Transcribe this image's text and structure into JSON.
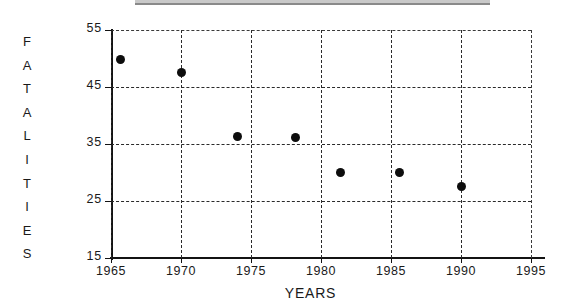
{
  "chart_data": {
    "type": "scatter",
    "title": "",
    "xlabel": "YEARS",
    "ylabel": "FATALITIES",
    "ylabel_letters": [
      "F",
      "A",
      "T",
      "A",
      "L",
      "I",
      "T",
      "I",
      "E",
      "S"
    ],
    "xlim": [
      1965,
      1995
    ],
    "ylim": [
      15,
      55
    ],
    "xticks": [
      1965,
      1970,
      1975,
      1980,
      1985,
      1990,
      1995
    ],
    "xtick_labels": [
      "1965",
      "1970",
      "1975",
      "1980",
      "1985",
      "1990",
      "1995"
    ],
    "yticks": [
      15,
      25,
      35,
      45,
      55
    ],
    "ytick_labels": [
      "15",
      "25",
      "35",
      "45",
      "55"
    ],
    "grid": true,
    "grid_style": "dashed",
    "legend": "none",
    "marker": "filled-circle",
    "marker_color": "#0d0d0d",
    "axis_color": "#131313",
    "background": "#ffffff",
    "points": [
      {
        "x": 1965.7,
        "y": 49.9
      },
      {
        "x": 1970.0,
        "y": 47.6
      },
      {
        "x": 1974.0,
        "y": 36.3
      },
      {
        "x": 1978.2,
        "y": 36.2
      },
      {
        "x": 1981.4,
        "y": 30.0
      },
      {
        "x": 1985.6,
        "y": 30.0
      },
      {
        "x": 1990.0,
        "y": 27.5
      }
    ]
  }
}
